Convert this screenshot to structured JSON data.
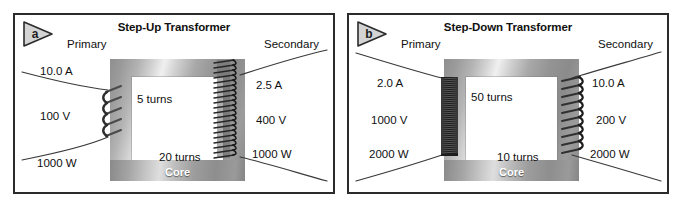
{
  "figure": {
    "caption_panels": 2,
    "colors": {
      "panel_border": "#2b2b2b",
      "core_gray_dark": "#8a8a8a",
      "core_gray_light": "#f0f0f0",
      "wire_line": "#3a3a3a",
      "text": "#101010",
      "core_label_text": "#ffffff"
    }
  },
  "panels": [
    {
      "id": "a",
      "marker_letter": "a",
      "title": "Step-Up Transformer",
      "primary_heading": "Primary",
      "secondary_heading": "Secondary",
      "core_label": "Core",
      "primary": {
        "current": "10.0 A",
        "voltage": "100 V",
        "power": "1000 W",
        "turns_label": "5 turns",
        "turns_count": 5
      },
      "secondary": {
        "current": "2.5 A",
        "voltage": "400 V",
        "power": "1000 W",
        "turns_label": "20 turns",
        "turns_count": 20
      }
    },
    {
      "id": "b",
      "marker_letter": "b",
      "title": "Step-Down Transformer",
      "primary_heading": "Primary",
      "secondary_heading": "Secondary",
      "core_label": "Core",
      "primary": {
        "current": "2.0 A",
        "voltage": "1000 V",
        "power": "2000 W",
        "turns_label": "50 turns",
        "turns_count": 50
      },
      "secondary": {
        "current": "10.0 A",
        "voltage": "200 V",
        "power": "2000 W",
        "turns_label": "10 turns",
        "turns_count": 10
      }
    }
  ]
}
